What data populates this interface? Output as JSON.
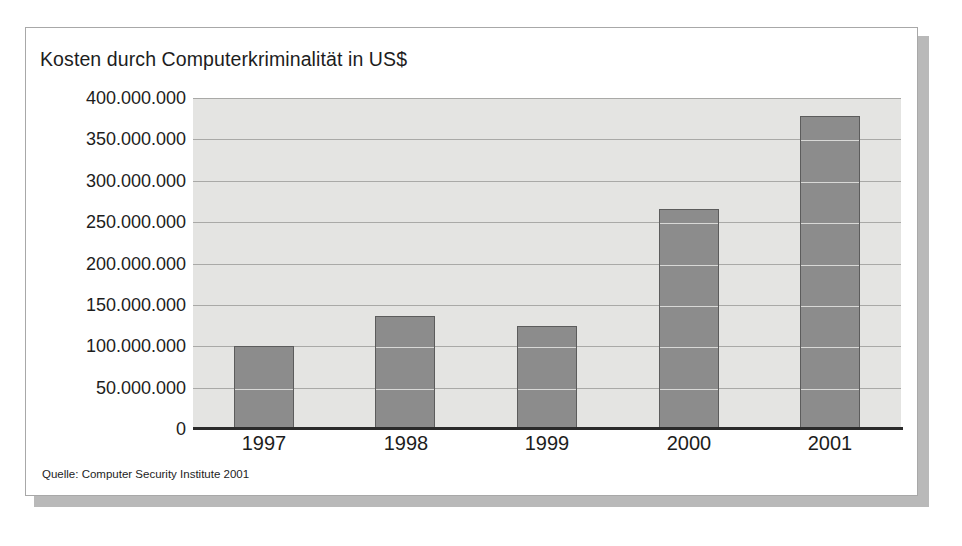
{
  "card": {
    "title": "Kosten durch Computerkriminalität in US$",
    "source": "Quelle: Computer Security Institute 2001"
  },
  "chart_data": {
    "type": "bar",
    "title": "Kosten durch Computerkriminalität in US$",
    "subtitle": "",
    "xlabel": "",
    "ylabel": "",
    "categories": [
      "1997",
      "1998",
      "1999",
      "2000",
      "2001"
    ],
    "values": [
      100000000,
      136000000,
      124000000,
      266000000,
      378000000
    ],
    "ylim": [
      0,
      400000000
    ],
    "ytick_values": [
      0,
      50000000,
      100000000,
      150000000,
      200000000,
      250000000,
      300000000,
      350000000,
      400000000
    ],
    "ytick_labels": [
      "400.000.000",
      "350.000.000",
      "300.000.000",
      "250.000.000",
      "200.000.000",
      "150.000.000",
      "100.000.000",
      "50.000.000",
      "0"
    ],
    "grid": true,
    "legend": false,
    "annotation": "Quelle: Computer Security Institute 2001",
    "colors": {
      "bar_fill": "#8c8c8c",
      "bar_outline": "#5c5c5c",
      "plot_background": "#e4e4e2",
      "gridline": "#a9a9a7",
      "axis": "#2b2b2b",
      "text": "#1d1d1d",
      "card_background": "#ffffff",
      "card_border": "#a8a8a8",
      "card_shadow": "#b9b9b9"
    }
  }
}
